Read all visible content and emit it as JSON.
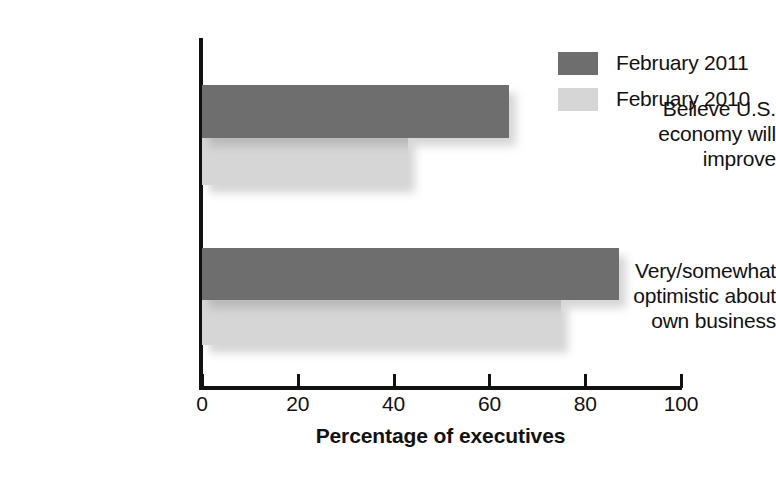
{
  "chart_data": {
    "type": "bar",
    "orientation": "horizontal",
    "title": "",
    "subtitle": "",
    "xlabel": "Percentage of executives",
    "ylabel": "",
    "xlim": [
      0,
      100
    ],
    "xticks": [
      0,
      20,
      40,
      60,
      80,
      100
    ],
    "xtick_labels": [
      "0",
      "20",
      "40",
      "60",
      "80",
      "100"
    ],
    "grid": false,
    "legend_position": "top-right",
    "categories": [
      "Believe U.S. economy will improve",
      "Very/somewhat optimistic about own business"
    ],
    "category_lines": [
      [
        "Believe U.S.",
        "economy will",
        "improve"
      ],
      [
        "Very/somewhat",
        "optimistic about",
        "own business"
      ]
    ],
    "series": [
      {
        "name": "February 2011",
        "color": "#6e6e6e",
        "values": [
          64,
          87
        ]
      },
      {
        "name": "February 2010",
        "color": "#d6d6d6",
        "values": [
          43,
          75
        ]
      }
    ]
  },
  "legend": {
    "items": [
      {
        "label": "February 2011",
        "swatch": "dark"
      },
      {
        "label": "February 2010",
        "swatch": "light"
      }
    ]
  },
  "axis": {
    "x_title": "Percentage of executives"
  },
  "colors": {
    "series_2011": "#6e6e6e",
    "series_2010": "#d6d6d6",
    "axis": "#111111",
    "background": "#ffffff"
  }
}
